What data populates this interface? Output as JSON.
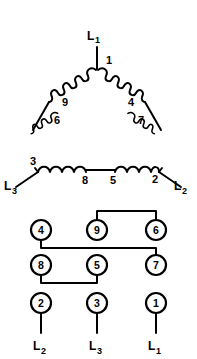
{
  "figure": {
    "stroke_color": "#000000",
    "background_color": "#ffffff"
  },
  "delta": {
    "apex_lead_label_main": "L",
    "apex_lead_label_sub": "1",
    "left_lead_label_main": "L",
    "left_lead_label_sub": "3",
    "right_lead_label_main": "L",
    "right_lead_label_sub": "2",
    "winding_numbers": {
      "apex": "1",
      "left_upper": "9",
      "left_lower": "6",
      "left_corner": "3",
      "right_upper": "4",
      "right_lower": "7",
      "right_corner": "2",
      "bottom_left": "8",
      "bottom_right": "5"
    }
  },
  "terminal_board": {
    "rows": [
      {
        "row_name": "row-top",
        "terminals": [
          {
            "number": "4",
            "cx": 41,
            "cy": 230
          },
          {
            "number": "9",
            "cx": 97,
            "cy": 230
          },
          {
            "number": "6",
            "cx": 156,
            "cy": 230
          }
        ]
      },
      {
        "row_name": "row-middle",
        "terminals": [
          {
            "number": "8",
            "cx": 41,
            "cy": 265
          },
          {
            "number": "5",
            "cx": 97,
            "cy": 265
          },
          {
            "number": "7",
            "cx": 156,
            "cy": 265
          }
        ]
      },
      {
        "row_name": "row-bottom",
        "terminals": [
          {
            "number": "2",
            "cx": 41,
            "cy": 303
          },
          {
            "number": "3",
            "cx": 97,
            "cy": 303
          },
          {
            "number": "1",
            "cx": 156,
            "cy": 303
          }
        ]
      }
    ],
    "jumpers": [
      {
        "name": "jumper-9-to-6",
        "from": "9",
        "to": "6"
      },
      {
        "name": "jumper-4-to-7",
        "from": "4",
        "to": "7"
      },
      {
        "name": "jumper-8-to-5",
        "from": "8",
        "to": "5"
      }
    ],
    "line_leads": [
      {
        "name": "lead-2",
        "terminal": "2",
        "label_main": "L",
        "label_sub": "2"
      },
      {
        "name": "lead-3",
        "terminal": "3",
        "label_main": "L",
        "label_sub": "3"
      },
      {
        "name": "lead-1",
        "terminal": "1",
        "label_main": "L",
        "label_sub": "1"
      }
    ]
  }
}
